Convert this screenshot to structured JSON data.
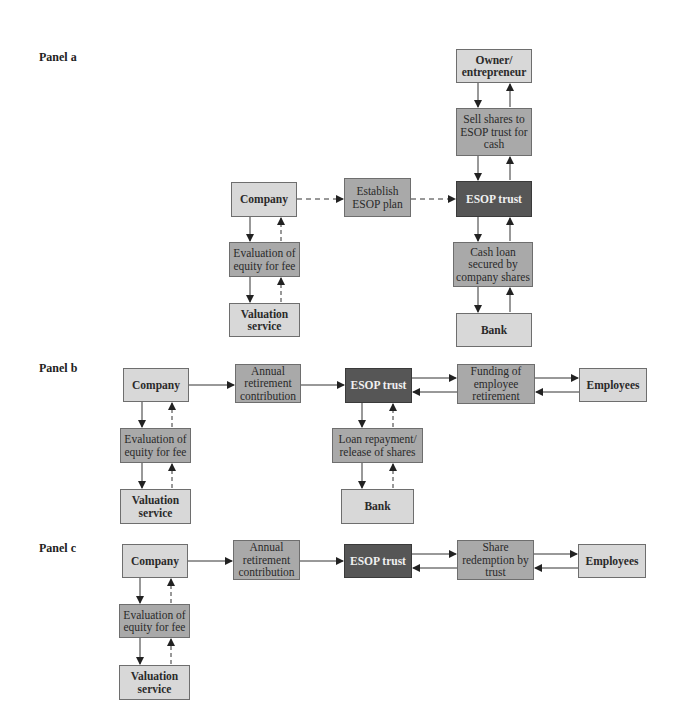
{
  "panels": [
    {
      "label": "Panel a",
      "nodes": {
        "owner": "Owner/\nentrepreneur",
        "sell_shares": "Sell shares to\nESOP trust for\ncash",
        "esop_trust": "ESOP trust",
        "cash_loan": "Cash loan\nsecured by\ncompany shares",
        "bank": "Bank",
        "company": "Company",
        "establish": "Establish\nESOP plan",
        "evaluation": "Evaluation of\nequity for fee",
        "valuation": "Valuation\nservice"
      }
    },
    {
      "label": "Panel b",
      "nodes": {
        "company": "Company",
        "annual": "Annual\nretirement\ncontribution",
        "esop_trust": "ESOP trust",
        "funding": "Funding of\nemployee\nretirement",
        "employees": "Employees",
        "evaluation": "Evaluation of\nequity for fee",
        "valuation": "Valuation\nservice",
        "loan_repayment": "Loan repayment/\nrelease of shares",
        "bank": "Bank"
      }
    },
    {
      "label": "Panel c",
      "nodes": {
        "company": "Company",
        "annual": "Annual\nretirement\ncontribution",
        "esop_trust": "ESOP trust",
        "share_redemption": "Share\nredemption by\ntrust",
        "employees": "Employees",
        "evaluation": "Evaluation of\nequity for fee",
        "valuation": "Valuation\nservice"
      }
    }
  ],
  "colors": {
    "light_box": "#d8d8d8",
    "mid_box": "#a9a9a9",
    "dark_box": "#565656",
    "arrow": "#222222"
  }
}
